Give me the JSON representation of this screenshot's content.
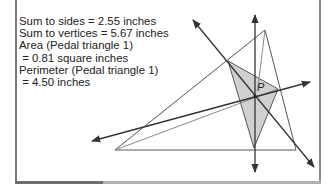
{
  "readouts": {
    "sum_to_sides": "Sum to sides = 2.55 inches",
    "sum_to_vertices": "Sum to vertices = 5.67 inches",
    "area_label": "Area (Pedal triangle 1)",
    "area_value": " = 0.81 square inches",
    "perimeter_label": "Perimeter (Pedal triangle 1)",
    "perimeter_value": " = 4.50 inches"
  },
  "diagram": {
    "point_label": "P",
    "pedal_fill": "#d0d0d0",
    "line_color": "#333333"
  }
}
